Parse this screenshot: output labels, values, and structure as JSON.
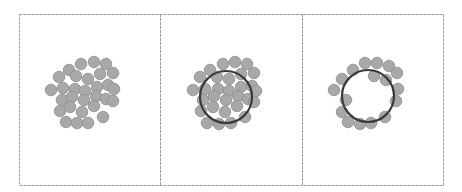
{
  "figure": {
    "width": 462,
    "height": 192,
    "frame": {
      "x": 19,
      "y": 14,
      "w": 424,
      "h": 171,
      "stroke": "#9a9a9a"
    },
    "dividers": [
      160,
      302
    ],
    "particle": {
      "r": 5.8,
      "fill": "#a8a8a8",
      "stroke": "#8e8e8e"
    },
    "ring": {
      "stroke": "#3a3a3a",
      "width": 2.2
    },
    "panels": [
      {
        "id": "panel-1-cluster",
        "ring": null,
        "particles": [
          [
            81,
            64
          ],
          [
            94,
            62
          ],
          [
            106,
            64
          ],
          [
            69,
            70
          ],
          [
            113,
            73
          ],
          [
            59,
            77
          ],
          [
            76,
            76
          ],
          [
            88,
            79
          ],
          [
            100,
            74
          ],
          [
            51,
            90
          ],
          [
            63,
            88
          ],
          [
            75,
            89
          ],
          [
            85,
            91
          ],
          [
            97,
            87
          ],
          [
            108,
            85
          ],
          [
            114,
            89
          ],
          [
            62,
            100
          ],
          [
            72,
            97
          ],
          [
            84,
            100
          ],
          [
            96,
            96
          ],
          [
            106,
            99
          ],
          [
            113,
            101
          ],
          [
            60,
            111
          ],
          [
            70,
            107
          ],
          [
            82,
            112
          ],
          [
            94,
            106
          ],
          [
            103,
            117
          ],
          [
            66,
            122
          ],
          [
            77,
            123
          ],
          [
            88,
            123
          ]
        ]
      },
      {
        "id": "panel-2-cluster-with-ring",
        "ring": {
          "cx": 226,
          "cy": 97,
          "r": 26
        },
        "particles": [
          [
            223,
            64
          ],
          [
            235,
            62
          ],
          [
            247,
            64
          ],
          [
            210,
            70
          ],
          [
            254,
            73
          ],
          [
            200,
            77
          ],
          [
            217,
            77
          ],
          [
            229,
            79
          ],
          [
            241,
            74
          ],
          [
            193,
            90
          ],
          [
            205,
            89
          ],
          [
            218,
            89
          ],
          [
            229,
            91
          ],
          [
            241,
            87
          ],
          [
            252,
            86
          ],
          [
            256,
            91
          ],
          [
            203,
            100
          ],
          [
            214,
            96
          ],
          [
            226,
            100
          ],
          [
            238,
            96
          ],
          [
            248,
            99
          ],
          [
            254,
            102
          ],
          [
            201,
            111
          ],
          [
            213,
            107
          ],
          [
            225,
            112
          ],
          [
            237,
            106
          ],
          [
            245,
            117
          ],
          [
            207,
            123
          ],
          [
            219,
            124
          ],
          [
            231,
            123
          ]
        ]
      },
      {
        "id": "panel-3-ring-shell",
        "ring": {
          "cx": 368,
          "cy": 96,
          "r": 26
        },
        "particles": [
          [
            353,
            70
          ],
          [
            365,
            63
          ],
          [
            377,
            63
          ],
          [
            389,
            66
          ],
          [
            397,
            73
          ],
          [
            342,
            79
          ],
          [
            374,
            76
          ],
          [
            386,
            80
          ],
          [
            334,
            90
          ],
          [
            398,
            89
          ],
          [
            346,
            100
          ],
          [
            396,
            101
          ],
          [
            342,
            112
          ],
          [
            348,
            122
          ],
          [
            360,
            124
          ],
          [
            371,
            123
          ],
          [
            385,
            117
          ]
        ]
      }
    ]
  }
}
